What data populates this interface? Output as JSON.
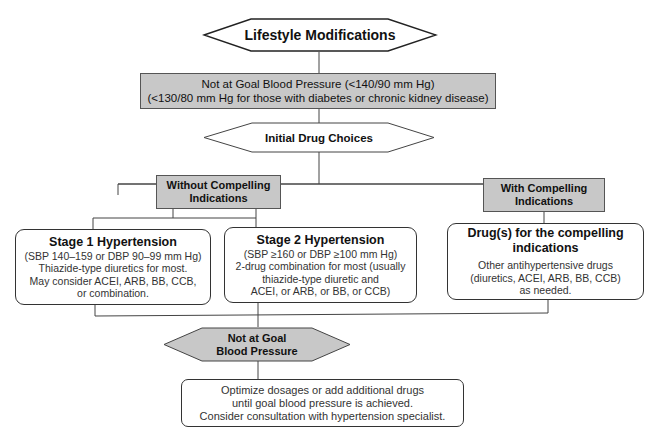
{
  "diagram": {
    "lifestyle": {
      "label": "Lifestyle Modifications"
    },
    "not_at_goal_top": {
      "line1": "Not at Goal Blood Pressure (<140/90 mm Hg)",
      "line2": "(<130/80 mm Hg for those with diabetes or chronic kidney disease)"
    },
    "initial_drug": {
      "label": "Initial Drug Choices"
    },
    "without_compelling": {
      "line1": "Without Compelling",
      "line2": "Indications"
    },
    "with_compelling": {
      "line1": "With Compelling",
      "line2": "Indications"
    },
    "stage1": {
      "title": "Stage 1 Hypertension",
      "lines": [
        "(SBP 140–159 or DBP 90–99 mm Hg)",
        "Thiazide-type diuretics for most.",
        "May consider ACEI, ARB, BB, CCB,",
        "or combination."
      ]
    },
    "stage2": {
      "title": "Stage 2 Hypertension",
      "lines": [
        "(SBP ≥160 or DBP ≥100 mm Hg)",
        "2-drug combination for most (usually",
        "thiazide-type diuretic and",
        "ACEI, or ARB, or BB, or CCB)"
      ]
    },
    "compelling_drugs": {
      "title1": "Drug(s) for the compelling",
      "title2": "indications",
      "lines": [
        "Other antihypertensive drugs",
        "(diuretics, ACEI, ARB, BB, CCB)",
        "as needed."
      ]
    },
    "not_at_goal_bottom": {
      "line1": "Not at Goal",
      "line2": "Blood Pressure"
    },
    "optimize": {
      "lines": [
        "Optimize dosages or add additional drugs",
        "until goal blood pressure is achieved.",
        "Consider consultation with hypertension specialist."
      ]
    },
    "colors": {
      "gray_fill": "#c8c8c8",
      "line": "#444444",
      "white_fill": "#ffffff"
    }
  }
}
